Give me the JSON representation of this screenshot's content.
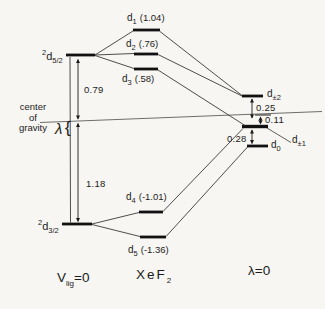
{
  "colors": {
    "paper": "#f7f6f2",
    "ink": "#1b1b1b",
    "line": "#3a3a3a"
  },
  "left_column": {
    "upper_level": {
      "sup": "2",
      "base": "d",
      "sub": "5/2"
    },
    "lower_level": {
      "sup": "2",
      "base": "d",
      "sub": "3/2"
    },
    "center_of_gravity": [
      "center",
      "of",
      "gravity"
    ],
    "lambda_symbol": "λ",
    "lambda_brace": "{",
    "gap_upper": "0.79",
    "gap_lower": "1.18",
    "footer": {
      "base": "V",
      "sub": "lig",
      "eq": "=0"
    }
  },
  "middle_column": {
    "levels": [
      {
        "base": "d",
        "sub": "1",
        "val": "(1.04)"
      },
      {
        "base": "d",
        "sub": "2",
        "val": "(.76)"
      },
      {
        "base": "d",
        "sub": "3",
        "val": "(.58)"
      },
      {
        "base": "d",
        "sub": "4",
        "val": "(-1.01)"
      },
      {
        "base": "d",
        "sub": "5",
        "val": "(-1.36)"
      }
    ],
    "footer": {
      "base": "XeF",
      "sub": "2"
    }
  },
  "right_column": {
    "levels": [
      {
        "base": "d",
        "sub": "±2"
      },
      {
        "base": "d",
        "sub": "±1"
      },
      {
        "base": "d",
        "sub": "0"
      }
    ],
    "gap_top": "0.25",
    "gap_mid": "0.11",
    "gap_bottom": "0.28",
    "footer": "λ=0"
  }
}
